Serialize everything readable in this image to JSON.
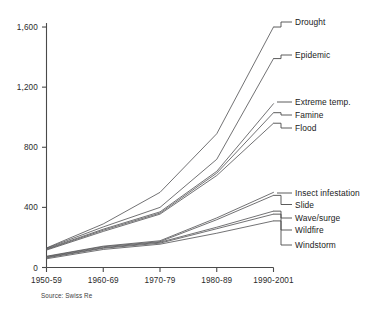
{
  "chart_data": {
    "type": "line",
    "title": "",
    "subtitle": "",
    "xlabel": "",
    "ylabel": "",
    "source": "Source: Swiss Re",
    "grid": false,
    "legend_position": "right-inline-labels",
    "categories": [
      "1950-59",
      "1960-69",
      "1970-79",
      "1980-89",
      "1990-2001"
    ],
    "ylim": [
      0,
      1700
    ],
    "yticks": [
      0,
      400,
      800,
      1200,
      1600
    ],
    "ytick_labels": [
      "0",
      "400",
      "800",
      "1,200",
      "1,600"
    ],
    "series": [
      {
        "name": "Drought",
        "values": [
          130,
          290,
          500,
          890,
          1600
        ]
      },
      {
        "name": "Epidemic",
        "values": [
          128,
          270,
          400,
          720,
          1390
        ]
      },
      {
        "name": "Extreme temp.",
        "values": [
          124,
          255,
          370,
          640,
          1090
        ]
      },
      {
        "name": "Famine",
        "values": [
          120,
          248,
          362,
          628,
          1030
        ]
      },
      {
        "name": "Flood",
        "values": [
          116,
          240,
          355,
          612,
          960
        ]
      },
      {
        "name": "Insect infestation",
        "values": [
          75,
          142,
          178,
          330,
          500
        ]
      },
      {
        "name": "Slide",
        "values": [
          72,
          138,
          172,
          318,
          480
        ]
      },
      {
        "name": "Wave/surge",
        "values": [
          68,
          132,
          168,
          268,
          375
        ]
      },
      {
        "name": "Wildfire",
        "values": [
          64,
          128,
          162,
          258,
          355
        ]
      },
      {
        "name": "Windstorm",
        "values": [
          58,
          120,
          155,
          228,
          310
        ]
      }
    ],
    "series_labels": [
      {
        "name": "Drought",
        "label": "Drought"
      },
      {
        "name": "Epidemic",
        "label": "Epidemic"
      },
      {
        "name": "Extreme temp.",
        "label": "Extreme temp."
      },
      {
        "name": "Famine",
        "label": "Famine"
      },
      {
        "name": "Flood",
        "label": "Flood"
      },
      {
        "name": "Insect infestation",
        "label": "Insect infestation"
      },
      {
        "name": "Slide",
        "label": "Slide"
      },
      {
        "name": "Wave/surge",
        "label": "Wave/surge"
      },
      {
        "name": "Wildfire",
        "label": "Wildfire"
      },
      {
        "name": "Windstorm",
        "label": "Windstorm"
      }
    ]
  },
  "colors": {
    "line": "#58595b",
    "axis": "#4a4a4a",
    "text": "#1a1a1a",
    "background": "#ffffff"
  }
}
